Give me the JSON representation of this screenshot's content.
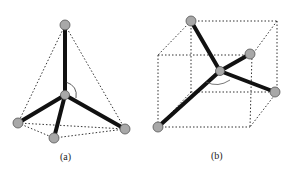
{
  "figure": {
    "panels": [
      {
        "id": "a",
        "label": "(a)",
        "shape": "tetrahedron",
        "center_atom": [
          65,
          95
        ],
        "outer_atoms": [
          [
            65,
            25
          ],
          [
            18,
            123
          ],
          [
            54,
            138
          ],
          [
            125,
            129
          ]
        ],
        "angle_arc": true
      },
      {
        "id": "b",
        "label": "(b)",
        "shape": "cube",
        "center_atom": [
          220,
          71
        ],
        "outer_atoms": [
          [
            191,
            21
          ],
          [
            250,
            54
          ],
          [
            275,
            92
          ],
          [
            158,
            127
          ]
        ],
        "angle_arc": true
      }
    ],
    "colors": {
      "bond": "#111111",
      "atom_fill": "#a8a8a8",
      "atom_stroke": "#555555",
      "dotted_edge": "#333333"
    }
  }
}
